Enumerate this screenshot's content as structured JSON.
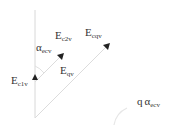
{
  "diagram": {
    "labels": {
      "e_c2v": {
        "main": "E",
        "sub": "c2v"
      },
      "e_cqv": {
        "main": "E",
        "sub": "cqv"
      },
      "alpha_ecv": {
        "main": "α",
        "sub": "ecv"
      },
      "e_c1v": {
        "main": "E",
        "sub": "c1v"
      },
      "e_qv": {
        "main": "E",
        "sub": "qv"
      },
      "q_alpha_ecv": {
        "prefix": "q",
        "main": "α",
        "sub": "ecv"
      }
    },
    "colors": {
      "line": "#d8d8d8",
      "arrow": "#222222",
      "text": "#333333"
    }
  }
}
